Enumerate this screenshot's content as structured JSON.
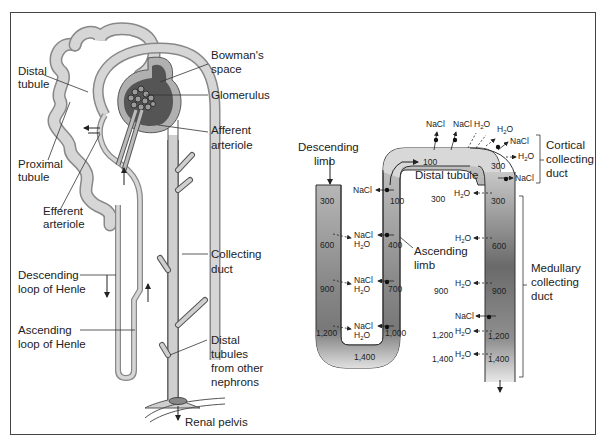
{
  "left_panel": {
    "labels": {
      "distal_tubule": [
        "Distal",
        "tubule"
      ],
      "proximal_tubule": [
        "Proximal",
        "tubule"
      ],
      "efferent_arteriole": [
        "Efferent",
        "arteriole"
      ],
      "descending_loop": [
        "Descending",
        "loop of Henle"
      ],
      "ascending_loop": [
        "Ascending",
        "loop of Henle"
      ],
      "bowmans_space": [
        "Bowman's",
        "space"
      ],
      "glomerulus": "Glomerulus",
      "afferent_arteriole": [
        "Afferent",
        "arteriole"
      ],
      "collecting_duct": [
        "Collecting",
        "duct"
      ],
      "distal_tubules_other": [
        "Distal",
        "tubules",
        "from other",
        "nephrons"
      ],
      "renal_pelvis": "Renal pelvis"
    }
  },
  "right_panel": {
    "labels": {
      "descending_limb": [
        "Descending",
        "limb"
      ],
      "ascending_limb": [
        "Ascending",
        "limb"
      ],
      "distal_tubule": "Distal tubule",
      "cortical_collecting_duct": [
        "Cortical",
        "collecting",
        "duct"
      ],
      "medullary_collecting_duct": [
        "Medullary",
        "collecting",
        "duct"
      ]
    },
    "osmolarity": {
      "descending": [
        "300",
        "600",
        "900",
        "1,200"
      ],
      "bottom": "1,400",
      "ascending": [
        "100",
        "400",
        "700",
        "1,000"
      ],
      "distal_top": "100",
      "interstitial": [
        "300",
        "900",
        "1,200",
        "1,400"
      ],
      "collecting": [
        "300",
        "300",
        "600",
        "900",
        "1,200",
        "1,400"
      ]
    },
    "solutes": {
      "nacl": "NaCl",
      "h2o_main": "H",
      "h2o_sub": "2",
      "h2o_end": "O"
    }
  },
  "colors": {
    "tube_light": "#d9d9d9",
    "tube_dark": "#6e6e6e",
    "bowman_dark": "#555555",
    "outline": "#333333"
  }
}
